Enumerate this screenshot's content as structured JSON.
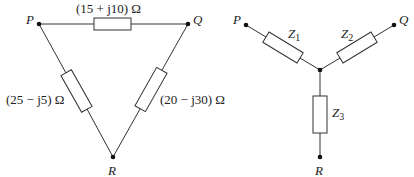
{
  "delta": {
    "nodes": {
      "P": "P",
      "Q": "Q",
      "R": "R"
    },
    "impedances": {
      "PQ": "(15 + j10) Ω",
      "PR": "(25 − j5) Ω",
      "QR": "(20 − j30) Ω"
    }
  },
  "star": {
    "nodes": {
      "P": "P",
      "Q": "Q",
      "R": "R"
    },
    "impedances": {
      "Z1": {
        "base": "Z",
        "sub": "1"
      },
      "Z2": {
        "base": "Z",
        "sub": "2"
      },
      "Z3": {
        "base": "Z",
        "sub": "3"
      }
    }
  },
  "colors": {
    "line": "#333333",
    "background": "#ffffff"
  }
}
